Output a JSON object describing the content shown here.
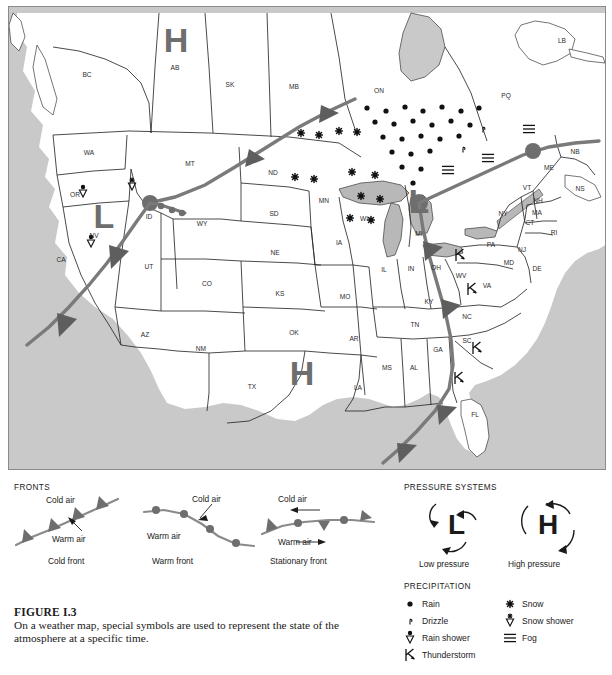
{
  "figure": {
    "label": "FIGURE I.3",
    "caption": "On a weather map, special symbols are used to represent the state of the atmosphere at a specific time."
  },
  "colors": {
    "front_line": "#7a7a7a",
    "front_symbol": "#5e5e5e",
    "water": "#c9c9c9",
    "land": "#ffffff",
    "state_border": "#2b2b2b",
    "symbol_black": "#111111",
    "pressure_letter": "#6e6e6e"
  },
  "map": {
    "regions": [
      {
        "code": "BC",
        "x": 78,
        "y": 70
      },
      {
        "code": "AB",
        "x": 166,
        "y": 63
      },
      {
        "code": "SK",
        "x": 221,
        "y": 80
      },
      {
        "code": "MB",
        "x": 285,
        "y": 82
      },
      {
        "code": "ON",
        "x": 370,
        "y": 86
      },
      {
        "code": "PQ",
        "x": 497,
        "y": 91
      },
      {
        "code": "LB",
        "x": 553,
        "y": 36
      },
      {
        "code": "NB",
        "x": 566,
        "y": 147
      },
      {
        "code": "NS",
        "x": 571,
        "y": 184
      },
      {
        "code": "ME",
        "x": 540,
        "y": 163
      },
      {
        "code": "VT",
        "x": 518,
        "y": 183
      },
      {
        "code": "NH",
        "x": 529,
        "y": 196
      },
      {
        "code": "MA",
        "x": 528,
        "y": 208
      },
      {
        "code": "CT",
        "x": 521,
        "y": 218
      },
      {
        "code": "RI",
        "x": 545,
        "y": 228
      },
      {
        "code": "NY",
        "x": 494,
        "y": 209
      },
      {
        "code": "PA",
        "x": 482,
        "y": 240
      },
      {
        "code": "NJ",
        "x": 513,
        "y": 245
      },
      {
        "code": "MD",
        "x": 500,
        "y": 258
      },
      {
        "code": "DE",
        "x": 528,
        "y": 264
      },
      {
        "code": "WA",
        "x": 80,
        "y": 148
      },
      {
        "code": "OR",
        "x": 66,
        "y": 190
      },
      {
        "code": "CA",
        "x": 52,
        "y": 255
      },
      {
        "code": "NV",
        "x": 85,
        "y": 231
      },
      {
        "code": "ID",
        "x": 140,
        "y": 212
      },
      {
        "code": "MT",
        "x": 181,
        "y": 159
      },
      {
        "code": "WY",
        "x": 193,
        "y": 219
      },
      {
        "code": "UT",
        "x": 140,
        "y": 262
      },
      {
        "code": "CO",
        "x": 198,
        "y": 279
      },
      {
        "code": "AZ",
        "x": 136,
        "y": 330
      },
      {
        "code": "NM",
        "x": 192,
        "y": 344
      },
      {
        "code": "ND",
        "x": 264,
        "y": 168
      },
      {
        "code": "SD",
        "x": 265,
        "y": 209
      },
      {
        "code": "NE",
        "x": 266,
        "y": 248
      },
      {
        "code": "KS",
        "x": 271,
        "y": 289
      },
      {
        "code": "OK",
        "x": 285,
        "y": 328
      },
      {
        "code": "TX",
        "x": 243,
        "y": 382
      },
      {
        "code": "MN",
        "x": 315,
        "y": 196
      },
      {
        "code": "IA",
        "x": 330,
        "y": 238
      },
      {
        "code": "MO",
        "x": 336,
        "y": 292
      },
      {
        "code": "AR",
        "x": 345,
        "y": 334
      },
      {
        "code": "LA",
        "x": 349,
        "y": 383
      },
      {
        "code": "WI",
        "x": 355,
        "y": 214
      },
      {
        "code": "IL",
        "x": 375,
        "y": 265
      },
      {
        "code": "MI",
        "x": 410,
        "y": 229
      },
      {
        "code": "IN",
        "x": 402,
        "y": 264
      },
      {
        "code": "OH",
        "x": 427,
        "y": 263
      },
      {
        "code": "KY",
        "x": 420,
        "y": 297
      },
      {
        "code": "TN",
        "x": 406,
        "y": 320
      },
      {
        "code": "MS",
        "x": 378,
        "y": 363
      },
      {
        "code": "AL",
        "x": 405,
        "y": 363
      },
      {
        "code": "GA",
        "x": 429,
        "y": 345
      },
      {
        "code": "FL",
        "x": 466,
        "y": 410
      },
      {
        "code": "SC",
        "x": 458,
        "y": 336
      },
      {
        "code": "NC",
        "x": 458,
        "y": 312
      },
      {
        "code": "VA",
        "x": 478,
        "y": 281
      },
      {
        "code": "WV",
        "x": 452,
        "y": 271
      }
    ],
    "pressure_markers": [
      {
        "type": "H",
        "label": "H",
        "x": 167,
        "y": 45,
        "size": 34
      },
      {
        "type": "H",
        "label": "H",
        "x": 293,
        "y": 378,
        "size": 34
      },
      {
        "type": "L",
        "label": "L",
        "x": 95,
        "y": 221,
        "size": 34
      },
      {
        "type": "L",
        "label": "L",
        "x": 410,
        "y": 206,
        "size": 34
      }
    ],
    "precip_symbols": [
      {
        "kind": "rain_shower",
        "x": 74,
        "y": 185
      },
      {
        "kind": "rain_shower",
        "x": 82,
        "y": 235
      },
      {
        "kind": "snow_shower",
        "x": 123,
        "y": 178
      },
      {
        "kind": "snow",
        "x": 292,
        "y": 126
      },
      {
        "kind": "snow",
        "x": 310,
        "y": 128
      },
      {
        "kind": "snow",
        "x": 330,
        "y": 124
      },
      {
        "kind": "snow",
        "x": 348,
        "y": 125
      },
      {
        "kind": "snow",
        "x": 286,
        "y": 170
      },
      {
        "kind": "snow",
        "x": 305,
        "y": 172
      },
      {
        "kind": "snow",
        "x": 343,
        "y": 165
      },
      {
        "kind": "snow",
        "x": 366,
        "y": 168
      },
      {
        "kind": "snow",
        "x": 352,
        "y": 189
      },
      {
        "kind": "snow",
        "x": 371,
        "y": 192
      },
      {
        "kind": "snow",
        "x": 341,
        "y": 211
      },
      {
        "kind": "snow",
        "x": 362,
        "y": 213
      },
      {
        "kind": "rain",
        "x": 358,
        "y": 101
      },
      {
        "kind": "rain",
        "x": 377,
        "y": 104
      },
      {
        "kind": "rain",
        "x": 396,
        "y": 100
      },
      {
        "kind": "rain",
        "x": 414,
        "y": 104
      },
      {
        "kind": "rain",
        "x": 433,
        "y": 100
      },
      {
        "kind": "rain",
        "x": 452,
        "y": 104
      },
      {
        "kind": "rain",
        "x": 470,
        "y": 101
      },
      {
        "kind": "rain",
        "x": 366,
        "y": 115
      },
      {
        "kind": "rain",
        "x": 385,
        "y": 117
      },
      {
        "kind": "rain",
        "x": 404,
        "y": 114
      },
      {
        "kind": "rain",
        "x": 423,
        "y": 118
      },
      {
        "kind": "rain",
        "x": 442,
        "y": 114
      },
      {
        "kind": "rain",
        "x": 461,
        "y": 118
      },
      {
        "kind": "rain",
        "x": 374,
        "y": 130
      },
      {
        "kind": "rain",
        "x": 393,
        "y": 132
      },
      {
        "kind": "rain",
        "x": 412,
        "y": 129
      },
      {
        "kind": "rain",
        "x": 431,
        "y": 132
      },
      {
        "kind": "rain",
        "x": 450,
        "y": 129
      },
      {
        "kind": "rain",
        "x": 383,
        "y": 145
      },
      {
        "kind": "rain",
        "x": 402,
        "y": 147
      },
      {
        "kind": "rain",
        "x": 421,
        "y": 144
      },
      {
        "kind": "rain",
        "x": 393,
        "y": 160
      },
      {
        "kind": "rain",
        "x": 412,
        "y": 162
      },
      {
        "kind": "rain",
        "x": 404,
        "y": 176
      },
      {
        "kind": "drizzle",
        "x": 474,
        "y": 122
      },
      {
        "kind": "drizzle",
        "x": 454,
        "y": 142
      },
      {
        "kind": "fog",
        "x": 520,
        "y": 122
      },
      {
        "kind": "fog",
        "x": 479,
        "y": 151
      },
      {
        "kind": "fog",
        "x": 439,
        "y": 163
      },
      {
        "kind": "thunderstorm",
        "x": 463,
        "y": 282
      },
      {
        "kind": "thunderstorm",
        "x": 451,
        "y": 248
      },
      {
        "kind": "thunderstorm",
        "x": 468,
        "y": 341
      },
      {
        "kind": "thunderstorm",
        "x": 450,
        "y": 371
      }
    ]
  },
  "legend": {
    "fronts": {
      "heading": "FRONTS",
      "items": [
        {
          "name": "cold_front",
          "caption": "Cold front",
          "cold_air": "Cold air",
          "warm_air": "Warm air"
        },
        {
          "name": "warm_front",
          "caption": "Warm front",
          "cold_air": "Cold air",
          "warm_air": "Warm air"
        },
        {
          "name": "stationary_front",
          "caption": "Stationary front",
          "cold_air": "Cold air",
          "warm_air": "Warm air"
        }
      ]
    },
    "pressure": {
      "heading": "PRESSURE SYSTEMS",
      "items": [
        {
          "symbol": "L",
          "caption": "Low pressure"
        },
        {
          "symbol": "H",
          "caption": "High pressure"
        }
      ]
    },
    "precipitation": {
      "heading": "PRECIPITATION",
      "left_items": [
        {
          "kind": "rain",
          "label": "Rain"
        },
        {
          "kind": "drizzle",
          "label": "Drizzle"
        },
        {
          "kind": "rain_shower",
          "label": "Rain shower"
        },
        {
          "kind": "thunderstorm",
          "label": "Thunderstorm"
        }
      ],
      "right_items": [
        {
          "kind": "snow",
          "label": "Snow"
        },
        {
          "kind": "snow_shower",
          "label": "Snow shower"
        },
        {
          "kind": "fog",
          "label": "Fog"
        }
      ]
    }
  }
}
